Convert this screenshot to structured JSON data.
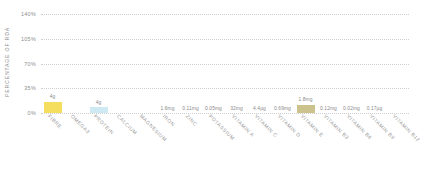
{
  "chart_data": {
    "type": "bar",
    "title": "",
    "subtitle": "",
    "xlabel": "",
    "ylabel": "PERCENTAGE OF RDA",
    "ylim": [
      0,
      140
    ],
    "grid": true,
    "legend": "none",
    "y_ticks": [
      {
        "value": 0,
        "label": "0%"
      },
      {
        "value": 35,
        "label": "35%"
      },
      {
        "value": 70,
        "label": "70%"
      },
      {
        "value": 105,
        "label": "105%"
      },
      {
        "value": 140,
        "label": "140%"
      }
    ],
    "categories": [
      "FIBRE",
      "OMEGA3",
      "PROTEIN",
      "CALCIUM",
      "MAGNESIUM",
      "IRON",
      "ZINC",
      "POTASSIUM",
      "VITAMIN A",
      "VITAMIN C",
      "VITAMIN D",
      "VITAMIN E",
      "VITAMIN B3",
      "VITAMIN B6",
      "VITAMIN B9",
      "VITAMIN B12"
    ],
    "values": [
      16,
      0,
      8,
      0,
      0,
      0,
      0,
      0,
      0,
      0,
      0,
      12,
      0,
      0,
      0,
      0
    ],
    "data_labels": [
      "4g",
      "",
      "4g",
      "",
      "",
      "1.6mg",
      "0.11mg",
      "0.05mg",
      "32mg",
      "4.4µg",
      "0.69mg",
      "1.8mg",
      "0.12mg",
      "0.02mg",
      "0.17µg",
      ""
    ],
    "bar_colors": [
      "#f5dd5d",
      "",
      "#cfe9f2",
      "",
      "",
      "",
      "",
      "",
      "",
      "",
      "",
      "#cbc28e",
      "",
      "",
      "",
      ""
    ],
    "colors": {
      "grid": "#cfcfcf",
      "axis_text": "#8d8d8d",
      "label_text": "#8a8a8a",
      "category_text": "#9a9a9a",
      "background": "#ffffff"
    }
  }
}
